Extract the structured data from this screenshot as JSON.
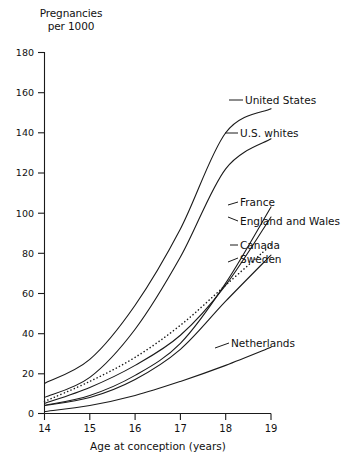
{
  "chart_data": {
    "type": "line",
    "title": "Pregnancies per 1000",
    "ylabel": "Pregnancies per 1000",
    "xlabel": "Age at conception (years)",
    "x": [
      14,
      15,
      16,
      17,
      18,
      19
    ],
    "xlim": [
      14,
      19
    ],
    "ylim": [
      0,
      180
    ],
    "xticks": [
      14,
      15,
      16,
      17,
      18,
      19
    ],
    "yticks": [
      0,
      20,
      40,
      60,
      80,
      100,
      120,
      140,
      160,
      180
    ],
    "grid": false,
    "legend_position": "right-inline-labels",
    "series": [
      {
        "name": "United States",
        "style": "solid",
        "values": [
          15,
          27,
          54,
          92,
          140,
          152
        ]
      },
      {
        "name": "U.S. whites",
        "style": "solid",
        "values": [
          8,
          18,
          42,
          78,
          122,
          137
        ]
      },
      {
        "name": "France",
        "style": "solid",
        "values": [
          4,
          9,
          19,
          35,
          65,
          103
        ]
      },
      {
        "name": "England and Wales",
        "style": "solid",
        "values": [
          5,
          13,
          24,
          39,
          64,
          98
        ]
      },
      {
        "name": "Canada",
        "style": "dotted",
        "values": [
          6,
          16,
          28,
          44,
          64,
          84
        ]
      },
      {
        "name": "Sweden",
        "style": "solid",
        "values": [
          4,
          8,
          17,
          32,
          56,
          79
        ]
      },
      {
        "name": "Netherlands",
        "style": "solid",
        "values": [
          1,
          4,
          9,
          16,
          24,
          33
        ]
      }
    ]
  },
  "labels": {
    "united_states": "United States",
    "us_whites": "U.S. whites",
    "france": "France",
    "england_and_wales": "England and Wales",
    "canada": "Canada",
    "sweden": "Sweden",
    "netherlands": "Netherlands"
  },
  "yticks": {
    "t180": "180",
    "t160": "160",
    "t140": "140",
    "t120": "120",
    "t100": "100",
    "t80": "80",
    "t60": "60",
    "t40": "40",
    "t20": "20",
    "t0": "0"
  },
  "xticks": {
    "t14": "14",
    "t15": "15",
    "t16": "16",
    "t17": "17",
    "t18": "18",
    "t19": "19"
  },
  "axis": {
    "y_title": "Pregnancies\nper 1000",
    "x_title": "Age at conception (years)"
  },
  "colors": {
    "ink": "#1a1a1a",
    "background": "#ffffff"
  }
}
